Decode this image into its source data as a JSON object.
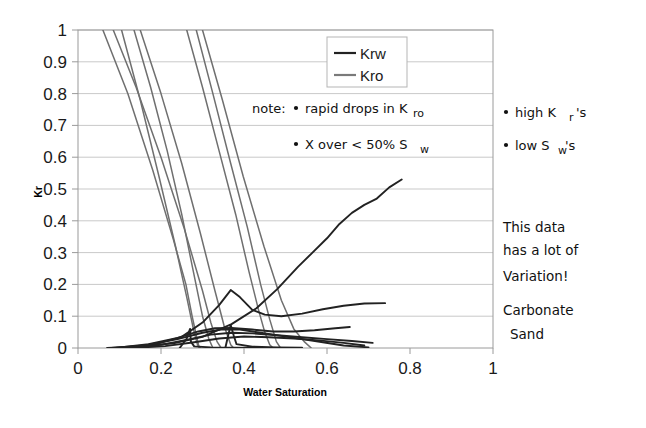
{
  "chart_data": {
    "type": "line",
    "title": "",
    "xlabel": "Water Saturation",
    "ylabel": "Kr",
    "xlim": [
      0,
      1
    ],
    "ylim": [
      0,
      1
    ],
    "xticks": [
      "0",
      "0.2",
      "0.4",
      "0.6",
      "0.8",
      "1"
    ],
    "xtick_values": [
      0,
      0.2,
      0.4,
      0.6,
      0.8,
      1
    ],
    "yticks": [
      "0",
      "0.1",
      "0.2",
      "0.3",
      "0.4",
      "0.5",
      "0.6",
      "0.7",
      "0.8",
      "0.9",
      "1"
    ],
    "ytick_values": [
      0,
      0.1,
      0.2,
      0.3,
      0.4,
      0.5,
      0.6,
      0.7,
      0.8,
      0.9,
      1
    ],
    "grid": "horizontal",
    "legend_position": "top-center",
    "legend": [
      {
        "name": "Krw",
        "color": "#222222"
      },
      {
        "name": "Kro",
        "color": "#7a7a7a"
      }
    ],
    "series": [
      {
        "name": "Kro",
        "color": "#6f6f6f",
        "points": [
          [
            0.06,
            1.0
          ],
          [
            0.12,
            0.8
          ],
          [
            0.18,
            0.56
          ],
          [
            0.23,
            0.34
          ],
          [
            0.26,
            0.2
          ],
          [
            0.275,
            0.1
          ],
          [
            0.285,
            0.04
          ],
          [
            0.292,
            0.0
          ]
        ]
      },
      {
        "name": "Kro",
        "color": "#6f6f6f",
        "points": [
          [
            0.085,
            1.0
          ],
          [
            0.14,
            0.82
          ],
          [
            0.2,
            0.6
          ],
          [
            0.255,
            0.38
          ],
          [
            0.3,
            0.18
          ],
          [
            0.32,
            0.08
          ],
          [
            0.335,
            0.02
          ],
          [
            0.345,
            0.0
          ]
        ]
      },
      {
        "name": "Kro",
        "color": "#6f6f6f",
        "points": [
          [
            0.105,
            1.0
          ],
          [
            0.15,
            0.78
          ],
          [
            0.195,
            0.54
          ],
          [
            0.235,
            0.32
          ],
          [
            0.262,
            0.16
          ],
          [
            0.278,
            0.06
          ],
          [
            0.288,
            0.01
          ],
          [
            0.295,
            0.0
          ]
        ]
      },
      {
        "name": "Kro",
        "color": "#6f6f6f",
        "points": [
          [
            0.135,
            1.0
          ],
          [
            0.175,
            0.82
          ],
          [
            0.215,
            0.62
          ],
          [
            0.25,
            0.42
          ],
          [
            0.278,
            0.24
          ],
          [
            0.3,
            0.1
          ],
          [
            0.315,
            0.03
          ],
          [
            0.325,
            0.0
          ]
        ]
      },
      {
        "name": "Kro",
        "color": "#6f6f6f",
        "points": [
          [
            0.15,
            1.0
          ],
          [
            0.2,
            0.8
          ],
          [
            0.25,
            0.58
          ],
          [
            0.295,
            0.36
          ],
          [
            0.33,
            0.18
          ],
          [
            0.352,
            0.07
          ],
          [
            0.368,
            0.01
          ],
          [
            0.375,
            0.0
          ]
        ]
      },
      {
        "name": "Kro",
        "color": "#6f6f6f",
        "points": [
          [
            0.262,
            1.0
          ],
          [
            0.3,
            0.82
          ],
          [
            0.34,
            0.62
          ],
          [
            0.38,
            0.42
          ],
          [
            0.412,
            0.24
          ],
          [
            0.435,
            0.12
          ],
          [
            0.45,
            0.05
          ],
          [
            0.462,
            0.01
          ],
          [
            0.47,
            0.0
          ]
        ]
      },
      {
        "name": "Kro",
        "color": "#6f6f6f",
        "points": [
          [
            0.285,
            1.0
          ],
          [
            0.325,
            0.8
          ],
          [
            0.368,
            0.58
          ],
          [
            0.408,
            0.38
          ],
          [
            0.44,
            0.2
          ],
          [
            0.462,
            0.09
          ],
          [
            0.478,
            0.02
          ],
          [
            0.488,
            0.0
          ]
        ]
      },
      {
        "name": "Kro",
        "color": "#6f6f6f",
        "points": [
          [
            0.3,
            1.0
          ],
          [
            0.348,
            0.78
          ],
          [
            0.398,
            0.54
          ],
          [
            0.448,
            0.32
          ],
          [
            0.49,
            0.15
          ],
          [
            0.52,
            0.06
          ],
          [
            0.545,
            0.02
          ],
          [
            0.562,
            0.0
          ]
        ]
      },
      {
        "name": "Krw",
        "color": "#222222",
        "points": [
          [
            0.07,
            0.0
          ],
          [
            0.15,
            0.005
          ],
          [
            0.23,
            0.015
          ],
          [
            0.3,
            0.035
          ],
          [
            0.37,
            0.075
          ],
          [
            0.43,
            0.125
          ],
          [
            0.48,
            0.185
          ],
          [
            0.53,
            0.255
          ],
          [
            0.565,
            0.3
          ],
          [
            0.6,
            0.345
          ],
          [
            0.63,
            0.39
          ],
          [
            0.66,
            0.425
          ],
          [
            0.69,
            0.45
          ],
          [
            0.72,
            0.47
          ],
          [
            0.75,
            0.505
          ],
          [
            0.78,
            0.53
          ]
        ]
      },
      {
        "name": "Krw",
        "color": "#222222",
        "points": [
          [
            0.1,
            0.0
          ],
          [
            0.18,
            0.01
          ],
          [
            0.25,
            0.035
          ],
          [
            0.3,
            0.08
          ],
          [
            0.34,
            0.135
          ],
          [
            0.368,
            0.182
          ],
          [
            0.39,
            0.16
          ],
          [
            0.42,
            0.12
          ],
          [
            0.45,
            0.105
          ],
          [
            0.49,
            0.1
          ],
          [
            0.54,
            0.108
          ],
          [
            0.59,
            0.122
          ],
          [
            0.64,
            0.133
          ],
          [
            0.69,
            0.14
          ],
          [
            0.74,
            0.141
          ]
        ]
      },
      {
        "name": "Krw",
        "color": "#222222",
        "points": [
          [
            0.09,
            0.0
          ],
          [
            0.17,
            0.012
          ],
          [
            0.24,
            0.032
          ],
          [
            0.29,
            0.052
          ],
          [
            0.33,
            0.062
          ],
          [
            0.37,
            0.063
          ],
          [
            0.42,
            0.058
          ],
          [
            0.47,
            0.052
          ],
          [
            0.52,
            0.052
          ],
          [
            0.57,
            0.056
          ],
          [
            0.62,
            0.062
          ],
          [
            0.655,
            0.066
          ]
        ]
      },
      {
        "name": "Krw",
        "color": "#222222",
        "points": [
          [
            0.08,
            0.0
          ],
          [
            0.16,
            0.008
          ],
          [
            0.24,
            0.028
          ],
          [
            0.3,
            0.048
          ],
          [
            0.345,
            0.058
          ],
          [
            0.39,
            0.058
          ],
          [
            0.44,
            0.048
          ],
          [
            0.49,
            0.038
          ],
          [
            0.54,
            0.028
          ],
          [
            0.59,
            0.018
          ],
          [
            0.64,
            0.008
          ],
          [
            0.7,
            0.002
          ]
        ]
      },
      {
        "name": "Krw",
        "color": "#222222",
        "points": [
          [
            0.11,
            0.0
          ],
          [
            0.2,
            0.01
          ],
          [
            0.27,
            0.028
          ],
          [
            0.32,
            0.042
          ],
          [
            0.37,
            0.048
          ],
          [
            0.42,
            0.046
          ],
          [
            0.48,
            0.04
          ],
          [
            0.54,
            0.034
          ],
          [
            0.6,
            0.028
          ],
          [
            0.66,
            0.022
          ],
          [
            0.71,
            0.016
          ]
        ]
      },
      {
        "name": "Krw",
        "color": "#222222",
        "points": [
          [
            0.13,
            0.0
          ],
          [
            0.21,
            0.006
          ],
          [
            0.28,
            0.018
          ],
          [
            0.34,
            0.03
          ],
          [
            0.4,
            0.036
          ],
          [
            0.46,
            0.034
          ],
          [
            0.52,
            0.03
          ],
          [
            0.58,
            0.024
          ],
          [
            0.64,
            0.016
          ],
          [
            0.69,
            0.008
          ]
        ]
      },
      {
        "name": "Krw",
        "color": "#222222",
        "points": [
          [
            0.245,
            0.0
          ],
          [
            0.262,
            0.03
          ],
          [
            0.27,
            0.06
          ],
          [
            0.272,
            0.02
          ],
          [
            0.28,
            0.005
          ],
          [
            0.32,
            0.002
          ],
          [
            0.38,
            0.001
          ],
          [
            0.45,
            0.0
          ]
        ]
      },
      {
        "name": "Krw",
        "color": "#222222",
        "points": [
          [
            0.355,
            0.0
          ],
          [
            0.362,
            0.04
          ],
          [
            0.368,
            0.072
          ],
          [
            0.375,
            0.04
          ],
          [
            0.382,
            0.012
          ],
          [
            0.42,
            0.004
          ],
          [
            0.48,
            0.002
          ],
          [
            0.54,
            0.001
          ]
        ]
      }
    ]
  },
  "legend": {
    "items": [
      {
        "label": "Krw",
        "color": "#222222"
      },
      {
        "label": "Kro",
        "color": "#7a7a7a"
      }
    ]
  },
  "annotations": {
    "note_line1": "note:",
    "note_bullet1": "rapid drops in K",
    "note_bullet1_sub": "ro",
    "note_bullet2": "X over < 50% S",
    "note_bullet2_sub": "w",
    "right_bullet1": "high K",
    "right_bullet1_sub": "r",
    "right_bullet1_end": "'s",
    "right_bullet2": "low S",
    "right_bullet2_sub": "w",
    "right_bullet2_end": "'s",
    "side_line1": "This data",
    "side_line2": "has a lot of",
    "side_line3": "Variation!",
    "side_line4": "Carbonate",
    "side_line5": "Sand"
  }
}
